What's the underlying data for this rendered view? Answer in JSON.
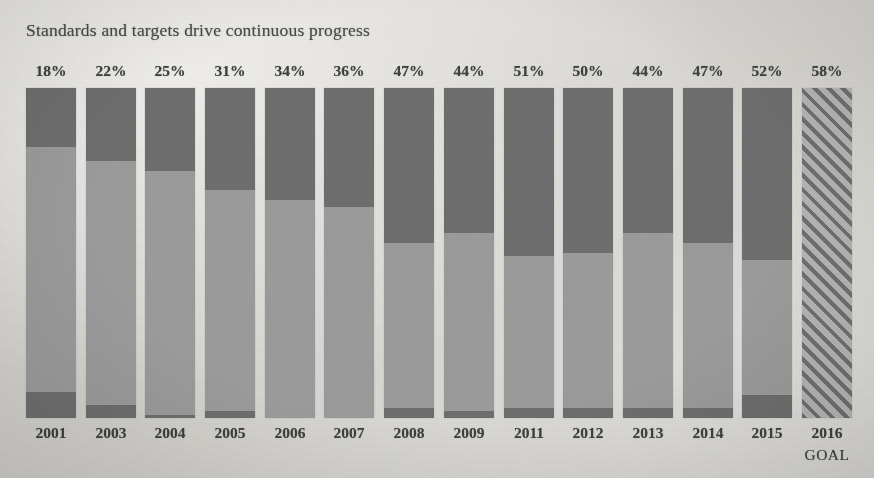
{
  "chart_data": {
    "type": "bar",
    "title": "Standards and targets drive continuous progress",
    "xlabel": "",
    "ylabel": "",
    "ylim": [
      0,
      100
    ],
    "grid": false,
    "legend": "none",
    "stacked": true,
    "categories": [
      "2001",
      "2003",
      "2004",
      "2005",
      "2006",
      "2007",
      "2008",
      "2009",
      "2011",
      "2012",
      "2013",
      "2014",
      "2015",
      "2016"
    ],
    "sublabels": [
      "",
      "",
      "",
      "",
      "",
      "",
      "",
      "",
      "",
      "",
      "",
      "",
      "",
      "GOAL"
    ],
    "data_labels": [
      "18%",
      "22%",
      "25%",
      "31%",
      "34%",
      "36%",
      "47%",
      "44%",
      "51%",
      "50%",
      "44%",
      "47%",
      "52%",
      "58%"
    ],
    "values": [
      18,
      22,
      25,
      31,
      34,
      36,
      47,
      44,
      51,
      50,
      44,
      47,
      52,
      58
    ],
    "series": [
      {
        "name": "top-dark",
        "values": [
          18,
          22,
          25,
          31,
          34,
          36,
          47,
          44,
          51,
          50,
          44,
          47,
          52,
          58
        ]
      },
      {
        "name": "middle-light",
        "values": [
          74,
          74,
          74,
          67,
          66,
          64,
          50,
          54,
          46,
          47,
          53,
          50,
          41,
          42
        ]
      },
      {
        "name": "bottom-dark",
        "values": [
          8,
          4,
          1,
          2,
          0,
          0,
          3,
          2,
          3,
          3,
          3,
          3,
          7,
          0
        ]
      }
    ],
    "goal_bar_index": 13,
    "goal_bar_style": "diagonal-hatch",
    "colors": {
      "dark": "#6e6e6e",
      "light": "#9b9b9b",
      "hatch_line": "#6f6f6f",
      "hatch_fill": "#b4b4b2",
      "background": "#d7d5d0",
      "text": "#3f3f3f"
    }
  }
}
